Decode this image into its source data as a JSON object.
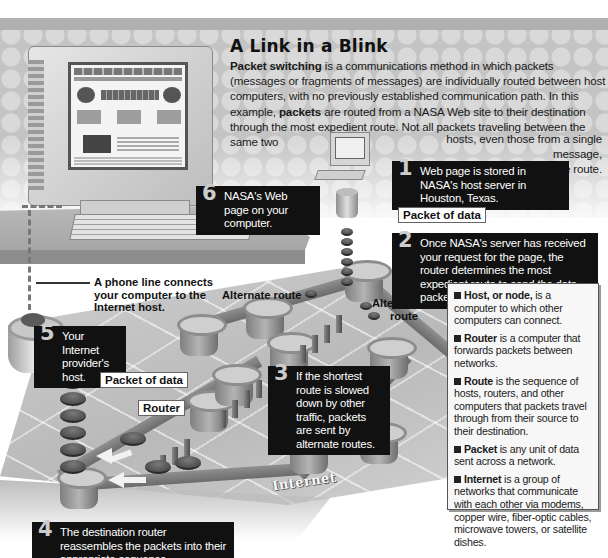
{
  "header": {
    "title": "A Link in a Blink",
    "intro_segments": [
      {
        "text": "Packet switching",
        "bold": true
      },
      {
        "text": " is a communications method in which packets (messages or fragments of messages) are individually routed between host computers, with no previously established communication path. In this example, ",
        "bold": false
      },
      {
        "text": "packets",
        "bold": true
      },
      {
        "text": " are routed from a NASA Web site to their destination through the most expedient route. Not all packets traveling between the same two",
        "bold": false
      }
    ],
    "intro_tail_line1": "hosts, even those from a single message,",
    "intro_tail_line2": "will necessarily follow the same route."
  },
  "steps": [
    {
      "num": "1",
      "text": "Web page is stored in NASA's host server in Houston, Texas."
    },
    {
      "num": "2",
      "text": "Once NASA's server has received your request for the page, the router determines the most expedient route to send the data packets to your computer."
    },
    {
      "num": "3",
      "text": "If the shortest route is slowed down by other traffic, packets are sent by alternate routes."
    },
    {
      "num": "4",
      "text": "The destination router reassembles the packets into their appropriate sequence."
    },
    {
      "num": "5",
      "text": "Your Internet provider's host."
    },
    {
      "num": "6",
      "text": "NASA's Web page on your computer."
    }
  ],
  "labels": {
    "packet_of_data_top": "Packet of data",
    "packet_of_data_left": "Packet of data",
    "router": "Router",
    "alternate_route_left": "Alternate route",
    "alternate_route_right_1": "Alternate",
    "alternate_route_right_2": "route",
    "phone_line_1": "A phone line connects",
    "phone_line_2": "your computer to the",
    "phone_line_3": "Internet host.",
    "internet": "Internet"
  },
  "glossary": [
    {
      "term": "Host, or node,",
      "definition": " is a computer to which other computers can connect."
    },
    {
      "term": "Router",
      "definition": " is a computer that forwards packets between networks."
    },
    {
      "term": "Route",
      "definition": " is the sequence of hosts, routers, and other computers that packets travel through from their source to their destination."
    },
    {
      "term": "Packet",
      "definition": " is any unit of data sent across a network."
    },
    {
      "term": "Internet",
      "definition": " is a group of networks that communicate with each other via modems, copper wire, fiber-optic cables, microwave towers, or satellite dishes."
    }
  ],
  "colors": {
    "callout_bg": "#111111",
    "callout_num": "#cccccc",
    "band": "#c4c4c4",
    "platform": "#c2c2c2"
  }
}
